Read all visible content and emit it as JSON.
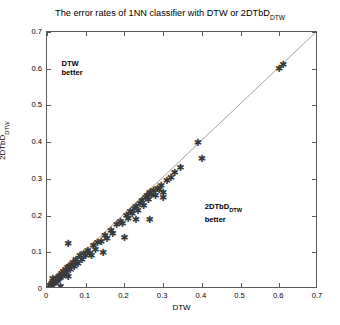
{
  "chart_data": {
    "type": "scatter",
    "title": "The error rates of 1NN classifier with DTW or 2DTbD",
    "title_sub": "DTW",
    "xlabel": "DTW",
    "ylabel": "2DTbD",
    "ylabel_sub": "DTW",
    "xlim": [
      0,
      0.7
    ],
    "ylim": [
      0,
      0.7
    ],
    "xticks": [
      0,
      0.1,
      0.2,
      0.3,
      0.4,
      0.5,
      0.6,
      0.7
    ],
    "xtick_labels": [
      "0",
      "0.1",
      "0.2",
      "0.3",
      "0.4",
      "0.5",
      "0.6",
      "0.7"
    ],
    "yticks": [
      0,
      0.1,
      0.2,
      0.3,
      0.4,
      0.5,
      0.6,
      0.7
    ],
    "ytick_labels": [
      "0",
      "0.1",
      "0.2",
      "0.3",
      "0.4",
      "0.5",
      "0.6",
      "0.7"
    ],
    "grid": false,
    "legend": "none",
    "marker": "asterisk",
    "marker_color": "#3a3a3a",
    "reference_line": {
      "type": "identity",
      "from": [
        0,
        0
      ],
      "to": [
        0.7,
        0.7
      ],
      "style": "thin-solid",
      "color": "#8a8a8a"
    },
    "annotations": [
      {
        "text": "DTW",
        "text2": "better",
        "x": 0.04,
        "y": 0.625
      },
      {
        "text": "2DTbD",
        "sub": "DTW",
        "text2": "better",
        "x": 0.41,
        "y": 0.235
      }
    ],
    "x": [
      0.0,
      0.003,
      0.005,
      0.007,
      0.008,
      0.01,
      0.012,
      0.013,
      0.015,
      0.017,
      0.018,
      0.02,
      0.022,
      0.023,
      0.025,
      0.027,
      0.03,
      0.032,
      0.034,
      0.035,
      0.038,
      0.04,
      0.042,
      0.045,
      0.048,
      0.05,
      0.053,
      0.057,
      0.06,
      0.063,
      0.067,
      0.07,
      0.075,
      0.08,
      0.085,
      0.09,
      0.095,
      0.1,
      0.105,
      0.11,
      0.12,
      0.125,
      0.13,
      0.14,
      0.15,
      0.155,
      0.165,
      0.17,
      0.18,
      0.19,
      0.195,
      0.205,
      0.21,
      0.215,
      0.22,
      0.225,
      0.23,
      0.235,
      0.24,
      0.245,
      0.25,
      0.255,
      0.258,
      0.262,
      0.265,
      0.27,
      0.275,
      0.28,
      0.285,
      0.29,
      0.295,
      0.3,
      0.31,
      0.32,
      0.33,
      0.345,
      0.39,
      0.4,
      0.6,
      0.61,
      0.015,
      0.035,
      0.055,
      0.115,
      0.145,
      0.2,
      0.23,
      0.265,
      0.3,
      0.055
    ],
    "y": [
      0.0,
      0.004,
      0.006,
      0.006,
      0.01,
      0.009,
      0.014,
      0.011,
      0.018,
      0.015,
      0.021,
      0.018,
      0.026,
      0.02,
      0.029,
      0.024,
      0.035,
      0.028,
      0.038,
      0.031,
      0.043,
      0.036,
      0.047,
      0.04,
      0.054,
      0.044,
      0.058,
      0.062,
      0.052,
      0.068,
      0.072,
      0.062,
      0.08,
      0.07,
      0.09,
      0.08,
      0.098,
      0.09,
      0.105,
      0.098,
      0.118,
      0.108,
      0.126,
      0.13,
      0.145,
      0.138,
      0.16,
      0.152,
      0.175,
      0.185,
      0.178,
      0.2,
      0.192,
      0.21,
      0.205,
      0.218,
      0.225,
      0.215,
      0.232,
      0.24,
      0.228,
      0.248,
      0.255,
      0.245,
      0.262,
      0.258,
      0.268,
      0.255,
      0.275,
      0.27,
      0.282,
      0.262,
      0.295,
      0.305,
      0.318,
      0.332,
      0.4,
      0.355,
      0.6,
      0.612,
      0.028,
      0.008,
      0.125,
      0.092,
      0.1,
      0.14,
      0.19,
      0.188,
      0.248,
      0.035
    ]
  }
}
